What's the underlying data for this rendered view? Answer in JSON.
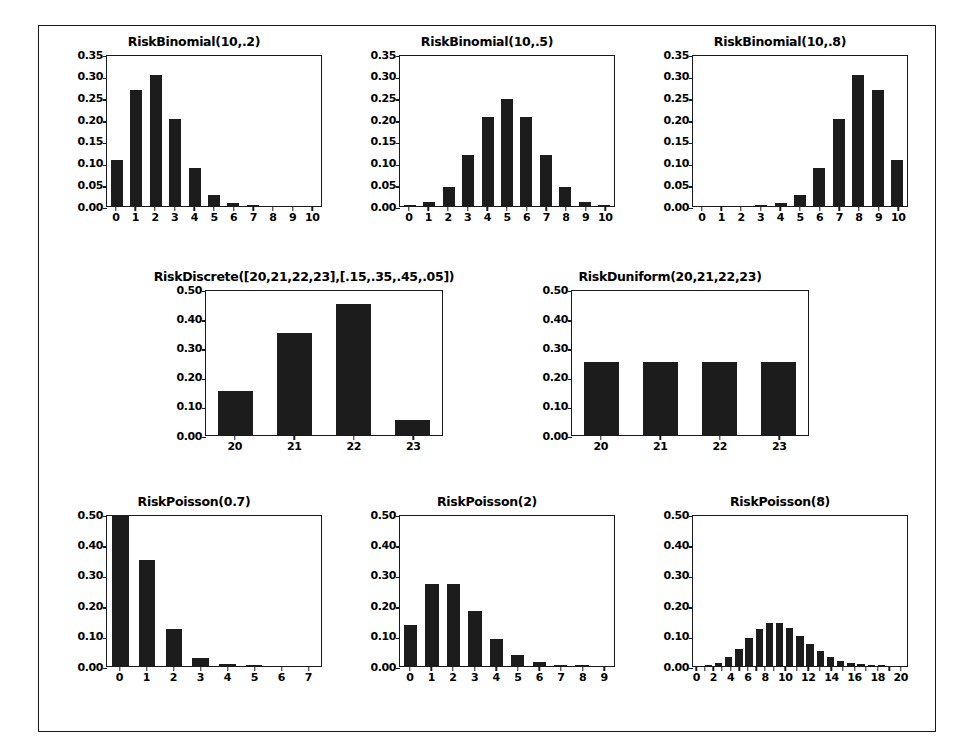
{
  "figure": {
    "background": "#ffffff",
    "ink_color": "#1a1a1a",
    "bar_color": "#1c1c1c",
    "layout": "3-2-3 grid of discrete distribution bar charts inside a thin rectangular border"
  },
  "chart_data": [
    {
      "id": "binomial-10-02",
      "type": "bar",
      "title": "RiskBinomial(10,.2)",
      "xlabel": "",
      "ylabel": "",
      "categories": [
        "0",
        "1",
        "2",
        "3",
        "4",
        "5",
        "6",
        "7",
        "8",
        "9",
        "10"
      ],
      "values": [
        0.107,
        0.268,
        0.302,
        0.201,
        0.088,
        0.026,
        0.006,
        0.001,
        0.0,
        0.0,
        0.0
      ],
      "ylim": [
        0,
        0.35
      ],
      "yticks": [
        "0.00",
        "0.05",
        "0.10",
        "0.15",
        "0.20",
        "0.25",
        "0.30",
        "0.35"
      ],
      "ytick_values": [
        0.0,
        0.05,
        0.1,
        0.15,
        0.2,
        0.25,
        0.3,
        0.35
      ],
      "grid": false,
      "legend": "none"
    },
    {
      "id": "binomial-10-05",
      "type": "bar",
      "title": "RiskBinomial(10,.5)",
      "xlabel": "",
      "ylabel": "",
      "categories": [
        "0",
        "1",
        "2",
        "3",
        "4",
        "5",
        "6",
        "7",
        "8",
        "9",
        "10"
      ],
      "values": [
        0.001,
        0.01,
        0.044,
        0.117,
        0.205,
        0.246,
        0.205,
        0.117,
        0.044,
        0.01,
        0.001
      ],
      "ylim": [
        0,
        0.35
      ],
      "yticks": [
        "0.00",
        "0.05",
        "0.10",
        "0.15",
        "0.20",
        "0.25",
        "0.30",
        "0.35"
      ],
      "ytick_values": [
        0.0,
        0.05,
        0.1,
        0.15,
        0.2,
        0.25,
        0.3,
        0.35
      ],
      "grid": false,
      "legend": "none"
    },
    {
      "id": "binomial-10-08",
      "type": "bar",
      "title": "RiskBinomial(10,.8)",
      "xlabel": "",
      "ylabel": "",
      "categories": [
        "0",
        "1",
        "2",
        "3",
        "4",
        "5",
        "6",
        "7",
        "8",
        "9",
        "10"
      ],
      "values": [
        0.0,
        0.0,
        0.0,
        0.001,
        0.006,
        0.026,
        0.088,
        0.201,
        0.302,
        0.268,
        0.107
      ],
      "ylim": [
        0,
        0.35
      ],
      "yticks": [
        "0.00",
        "0.05",
        "0.10",
        "0.15",
        "0.20",
        "0.25",
        "0.30",
        "0.35"
      ],
      "ytick_values": [
        0.0,
        0.05,
        0.1,
        0.15,
        0.2,
        0.25,
        0.3,
        0.35
      ],
      "grid": false,
      "legend": "none"
    },
    {
      "id": "discrete",
      "type": "bar",
      "title": "RiskDiscrete([20,21,22,23],[.15,.35,.45,.05])",
      "xlabel": "",
      "ylabel": "",
      "categories": [
        "20",
        "21",
        "22",
        "23"
      ],
      "values": [
        0.15,
        0.35,
        0.45,
        0.05
      ],
      "ylim": [
        0,
        0.5
      ],
      "yticks": [
        "0.00",
        "0.10",
        "0.20",
        "0.30",
        "0.40",
        "0.50"
      ],
      "ytick_values": [
        0.0,
        0.1,
        0.2,
        0.3,
        0.4,
        0.5
      ],
      "grid": false,
      "legend": "none"
    },
    {
      "id": "duniform",
      "type": "bar",
      "title": "RiskDuniform(20,21,22,23)",
      "xlabel": "",
      "ylabel": "",
      "categories": [
        "20",
        "21",
        "22",
        "23"
      ],
      "values": [
        0.25,
        0.25,
        0.25,
        0.25
      ],
      "ylim": [
        0,
        0.5
      ],
      "yticks": [
        "0.00",
        "0.10",
        "0.20",
        "0.30",
        "0.40",
        "0.50"
      ],
      "ytick_values": [
        0.0,
        0.1,
        0.2,
        0.3,
        0.4,
        0.5
      ],
      "grid": false,
      "legend": "none"
    },
    {
      "id": "poisson-07",
      "type": "bar",
      "title": "RiskPoisson(0.7)",
      "xlabel": "",
      "ylabel": "",
      "categories": [
        "0",
        "1",
        "2",
        "3",
        "4",
        "5",
        "6",
        "7"
      ],
      "values": [
        0.497,
        0.348,
        0.122,
        0.028,
        0.005,
        0.001,
        0.0,
        0.0
      ],
      "ylim": [
        0,
        0.5
      ],
      "yticks": [
        "0.00",
        "0.10",
        "0.20",
        "0.30",
        "0.40",
        "0.50"
      ],
      "ytick_values": [
        0.0,
        0.1,
        0.2,
        0.3,
        0.4,
        0.5
      ],
      "grid": false,
      "legend": "none"
    },
    {
      "id": "poisson-2",
      "type": "bar",
      "title": "RiskPoisson(2)",
      "xlabel": "",
      "ylabel": "",
      "categories": [
        "0",
        "1",
        "2",
        "3",
        "4",
        "5",
        "6",
        "7",
        "8",
        "9"
      ],
      "values": [
        0.135,
        0.271,
        0.271,
        0.18,
        0.09,
        0.036,
        0.012,
        0.003,
        0.001,
        0.0
      ],
      "ylim": [
        0,
        0.5
      ],
      "yticks": [
        "0.00",
        "0.10",
        "0.20",
        "0.30",
        "0.40",
        "0.50"
      ],
      "ytick_values": [
        0.0,
        0.1,
        0.2,
        0.3,
        0.4,
        0.5
      ],
      "grid": false,
      "legend": "none"
    },
    {
      "id": "poisson-8",
      "type": "bar",
      "title": "RiskPoisson(8)",
      "xlabel": "",
      "ylabel": "",
      "categories": [
        "0",
        "1",
        "2",
        "3",
        "4",
        "5",
        "6",
        "7",
        "8",
        "9",
        "10",
        "11",
        "12",
        "13",
        "14",
        "15",
        "16",
        "17",
        "18",
        "19",
        "20"
      ],
      "tick_labels": [
        "0",
        "",
        "2",
        "",
        "4",
        "",
        "6",
        "",
        "8",
        "",
        "10",
        "",
        "12",
        "",
        "14",
        "",
        "16",
        "",
        "18",
        "",
        "20"
      ],
      "values": [
        0.0,
        0.003,
        0.011,
        0.029,
        0.057,
        0.092,
        0.122,
        0.14,
        0.14,
        0.124,
        0.099,
        0.072,
        0.048,
        0.03,
        0.017,
        0.009,
        0.005,
        0.002,
        0.001,
        0.0,
        0.0
      ],
      "ylim": [
        0,
        0.5
      ],
      "yticks": [
        "0.00",
        "0.10",
        "0.20",
        "0.30",
        "0.40",
        "0.50"
      ],
      "ytick_values": [
        0.0,
        0.1,
        0.2,
        0.3,
        0.4,
        0.5
      ],
      "grid": false,
      "legend": "none"
    }
  ]
}
